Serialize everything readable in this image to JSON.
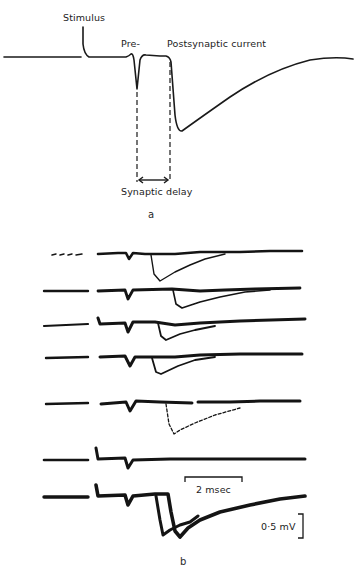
{
  "figure": {
    "panel_a": {
      "letter": "a",
      "labels": {
        "stimulus": "Stimulus",
        "pre": "Pre-",
        "post": "Postsynaptic current",
        "delay": "Synaptic delay"
      }
    },
    "panel_b": {
      "letter": "b",
      "trace_count": 7,
      "time_scale": "2 msec",
      "voltage_scale": "0·5 mV"
    },
    "colors": {
      "ink": "#1a1a1a",
      "background": "#ffffff"
    }
  }
}
